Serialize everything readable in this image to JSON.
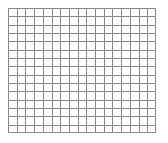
{
  "image": {
    "kind": "grid-graph-paper",
    "width": 168,
    "height": 143,
    "background_color": "#ffffff",
    "text_content": "",
    "labels": []
  },
  "grid": {
    "name": "graph-paper-grid",
    "origin_x": 8,
    "origin_y": 8,
    "width": 148,
    "height": 125,
    "columns": 17,
    "rows": 15,
    "cell_width": 8.7,
    "cell_height": 8.33,
    "line_color": "#8a8a8a",
    "line_color_light": "#c9c9c9",
    "border_color": "#8a8a8a",
    "cell_fill": "#fdfdfd",
    "line_width": 1,
    "border_width": 1
  }
}
